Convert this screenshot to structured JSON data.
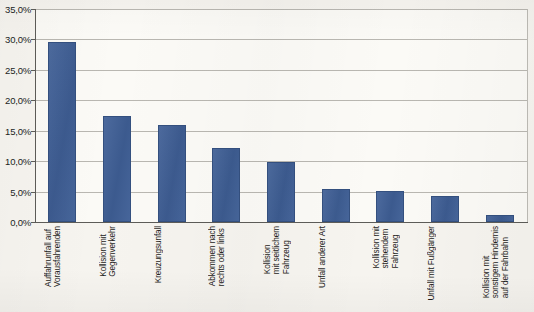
{
  "chart_data": {
    "type": "bar",
    "title": "",
    "subtitle": "",
    "xlabel": "",
    "ylabel": "",
    "ylim": [
      0,
      35
    ],
    "ytick_step": 5,
    "ytick_labels": [
      "0,0%",
      "5,0%",
      "10,0%",
      "15,0%",
      "20,0%",
      "25,0%",
      "30,0%",
      "35,0%"
    ],
    "ytick_values": [
      0,
      5,
      10,
      15,
      20,
      25,
      30,
      35
    ],
    "grid": "horizontal",
    "legend": "none",
    "bar_color": "#3f5f96",
    "plot_background": "#fbfaf6",
    "page_background": "#f6f4ef",
    "categories": [
      "Auffahrunfall auf\nVorausfahrenden",
      "Kollision mit\nGegenverkehr",
      "Kreuzungsunfall",
      "Abkommen nach\nrechts oder links",
      "Kollision\nmit seitlichem\nFahrzeug",
      "Unfall anderer Art",
      "Kollision mit\nstehendem\nFahrzeug",
      "Unfall mit Fußgänger",
      "Kollision mit\nsonstigem Hindernis\nauf der Fahrbahn"
    ],
    "values": [
      29.6,
      17.5,
      15.9,
      12.2,
      9.8,
      5.4,
      5.1,
      4.3,
      1.1
    ],
    "value_unit": "%"
  }
}
